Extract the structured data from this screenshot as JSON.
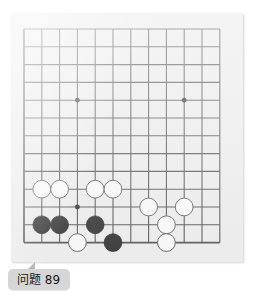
{
  "page": {
    "background_color": "#ffffff",
    "width": 256,
    "height": 296
  },
  "board": {
    "name": "go-board",
    "board_color": "#ececec",
    "line_color": "#3a3a3a",
    "panel": {
      "x": 11,
      "y": 13,
      "width": 232,
      "height": 249
    },
    "origin": {
      "x": 13,
      "y": 16
    },
    "spacing": 17.8,
    "cols": 12,
    "rows": 13,
    "star_points": [
      {
        "col": 3,
        "row": 4
      },
      {
        "col": 9,
        "row": 4
      },
      {
        "col": 3,
        "row": 10
      },
      {
        "col": 9,
        "row": 10
      }
    ],
    "edges": {
      "left": true,
      "top": true,
      "right": true,
      "bottom": true
    },
    "stones": [
      {
        "color": "white",
        "col": 1,
        "row": 9
      },
      {
        "color": "white",
        "col": 2,
        "row": 9
      },
      {
        "color": "white",
        "col": 4,
        "row": 9
      },
      {
        "color": "white",
        "col": 5,
        "row": 9
      },
      {
        "color": "white",
        "col": 7,
        "row": 10
      },
      {
        "color": "white",
        "col": 9,
        "row": 10
      },
      {
        "color": "black",
        "col": 1,
        "row": 11
      },
      {
        "color": "black",
        "col": 2,
        "row": 11
      },
      {
        "color": "black",
        "col": 4,
        "row": 11
      },
      {
        "color": "white",
        "col": 8,
        "row": 11
      },
      {
        "color": "white",
        "col": 3,
        "row": 12
      },
      {
        "color": "black",
        "col": 5,
        "row": 12
      },
      {
        "color": "white",
        "col": 8,
        "row": 12
      }
    ],
    "stone_colors": {
      "black_fill": "#111111",
      "black_edge": "#000000",
      "white_fill": "#fbfbfb",
      "white_edge": "#4a4a4a"
    }
  },
  "caption": {
    "label": "问题 89",
    "badge_color": "#d6d6d6",
    "text_color": "#1a1a1a"
  }
}
